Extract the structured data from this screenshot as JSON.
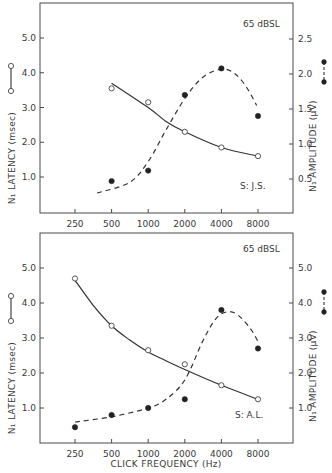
{
  "chart_data": [
    {
      "type": "line",
      "panel": "top",
      "title": "",
      "annotation_level": "65 dBSL",
      "annotation_subject": "S: J.S.",
      "xlabel": "",
      "x_scale": "log2",
      "x_ticks": [
        250,
        500,
        1000,
        2000,
        4000,
        8000
      ],
      "x_tick_labels": [
        "250",
        "500",
        "1000",
        "2000",
        "4000",
        "8000"
      ],
      "ylabel_left": "N₁ LATENCY (msec)",
      "ylabel_right": "N₁ AMPLITUDE (µV)",
      "y_left_ticks": [
        1.0,
        2.0,
        3.0,
        4.0,
        5.0
      ],
      "y_left_tick_labels": [
        "1.0",
        "2.0",
        "3.0",
        "4.0",
        "5.0"
      ],
      "y_right_ticks": [
        0.5,
        1.0,
        1.5,
        2.0,
        2.5
      ],
      "y_right_tick_labels": [
        "0.5",
        "1.0",
        "1.5",
        "2.0",
        "2.5"
      ],
      "ylim_left": [
        0,
        6
      ],
      "ylim_right": [
        0,
        3
      ],
      "series": [
        {
          "name": "N₁ Latency",
          "axis": "left",
          "marker": "open-circle",
          "line": "solid",
          "x": [
            500,
            1000,
            2000,
            4000,
            8000
          ],
          "values": [
            3.55,
            3.15,
            2.3,
            1.85,
            1.6
          ],
          "fit": [
            [
              500,
              3.7
            ],
            [
              1000,
              3.0
            ],
            [
              1400,
              2.6
            ],
            [
              2000,
              2.3
            ],
            [
              4000,
              1.85
            ],
            [
              8000,
              1.6
            ]
          ]
        },
        {
          "name": "N₁ Amplitude",
          "axis": "right",
          "marker": "filled-circle",
          "line": "dashed",
          "x": [
            500,
            1000,
            2000,
            4000,
            8000
          ],
          "values": [
            0.47,
            0.62,
            1.7,
            2.08,
            1.4
          ],
          "fit": [
            [
              380,
              0.3
            ],
            [
              700,
              0.45
            ],
            [
              1000,
              0.75
            ],
            [
              1400,
              1.2
            ],
            [
              2000,
              1.65
            ],
            [
              2800,
              1.95
            ],
            [
              4000,
              2.07
            ],
            [
              5200,
              2.0
            ],
            [
              6500,
              1.8
            ],
            [
              7800,
              1.55
            ]
          ]
        }
      ]
    },
    {
      "type": "line",
      "panel": "bottom",
      "title": "",
      "annotation_level": "65 dBSL",
      "annotation_subject": "S: A.L.",
      "xlabel": "CLICK FREQUENCY (Hz)",
      "x_scale": "log2",
      "x_ticks": [
        250,
        500,
        1000,
        2000,
        4000,
        8000
      ],
      "x_tick_labels": [
        "250",
        "500",
        "1000",
        "2000",
        "4000",
        "8000"
      ],
      "ylabel_left": "N₁ LATENCY (msec)",
      "ylabel_right": "N₁ AMPLITUDE (µV)",
      "y_left_ticks": [
        1.0,
        2.0,
        3.0,
        4.0,
        5.0
      ],
      "y_left_tick_labels": [
        "1.0",
        "2.0",
        "3.0",
        "4.0",
        "5.0"
      ],
      "y_right_ticks": [
        1.0,
        2.0,
        3.0,
        4.0,
        5.0
      ],
      "y_right_tick_labels": [
        "1.0",
        "2.0",
        "3.0",
        "4.0",
        "5.0"
      ],
      "ylim_left": [
        0,
        6
      ],
      "ylim_right": [
        0,
        6
      ],
      "series": [
        {
          "name": "N₁ Latency",
          "axis": "left",
          "marker": "open-circle",
          "line": "solid",
          "x": [
            250,
            500,
            1000,
            2000,
            4000,
            8000
          ],
          "values": [
            4.7,
            3.35,
            2.65,
            2.25,
            1.65,
            1.25
          ],
          "fit": [
            [
              250,
              4.65
            ],
            [
              350,
              3.95
            ],
            [
              500,
              3.35
            ],
            [
              700,
              2.95
            ],
            [
              1000,
              2.6
            ],
            [
              1400,
              2.35
            ],
            [
              2000,
              2.1
            ],
            [
              4000,
              1.65
            ],
            [
              8000,
              1.25
            ]
          ]
        },
        {
          "name": "N₁ Amplitude",
          "axis": "right",
          "marker": "filled-circle",
          "line": "dashed",
          "x": [
            250,
            500,
            1000,
            2000,
            4000,
            8000
          ],
          "values": [
            0.45,
            0.8,
            1.0,
            1.25,
            3.8,
            2.7
          ],
          "fit": [
            [
              250,
              0.6
            ],
            [
              500,
              0.75
            ],
            [
              1000,
              1.0
            ],
            [
              1400,
              1.25
            ],
            [
              2000,
              1.8
            ],
            [
              2800,
              2.9
            ],
            [
              3600,
              3.55
            ],
            [
              4500,
              3.75
            ],
            [
              5500,
              3.65
            ],
            [
              7000,
              3.25
            ],
            [
              8000,
              2.9
            ]
          ]
        }
      ]
    }
  ],
  "legend": {
    "latency_glyph": "open-circle-solid-line",
    "amplitude_glyph": "filled-circle-dashed-line"
  }
}
